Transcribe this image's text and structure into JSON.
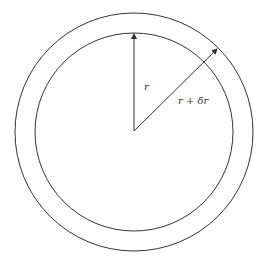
{
  "diagram": {
    "type": "concentric-circles",
    "center": {
      "x": 134,
      "y": 131
    },
    "inner_radius": 99,
    "outer_radius": 119,
    "labels": {
      "inner_radius_label": "r",
      "outer_radius_label": "r + δr"
    },
    "colors": {
      "stroke": "#333333",
      "background": "#ffffff"
    }
  }
}
